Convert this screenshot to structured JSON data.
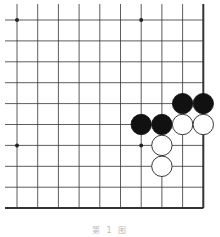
{
  "diagram": {
    "type": "go-board-fragment",
    "columns": 10,
    "rows": 10,
    "x_lines": [
      17,
      37.7,
      58.4,
      79.1,
      99.8,
      120.5,
      141.2,
      161.9,
      182.6,
      203.3
    ],
    "y_lines": [
      20,
      40.9,
      61.8,
      82.7,
      103.6,
      124.5,
      145.4,
      166.3,
      187.2,
      208.1
    ],
    "edges": {
      "right": true,
      "bottom": true,
      "left": false,
      "top": false
    },
    "star_points": [
      [
        0,
        0
      ],
      [
        6,
        0
      ],
      [
        0,
        6
      ],
      [
        6,
        6
      ]
    ],
    "stones": {
      "black": [
        [
          8,
          4
        ],
        [
          9,
          4
        ],
        [
          6,
          5
        ],
        [
          7,
          5
        ]
      ],
      "white": [
        [
          8,
          5
        ],
        [
          9,
          5
        ],
        [
          7,
          6
        ],
        [
          7,
          7
        ]
      ]
    },
    "colors": {
      "line": "#333333",
      "black_stone": "#111111",
      "white_stone": "#ffffff",
      "stone_outline": "#222222"
    }
  },
  "caption": "第 1 图"
}
